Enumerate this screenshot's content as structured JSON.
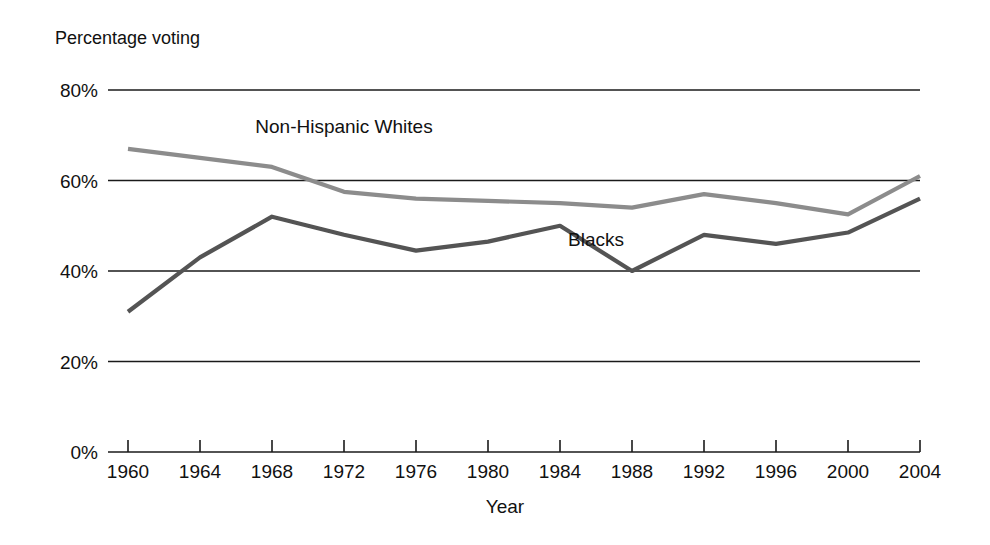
{
  "chart_data": {
    "type": "line",
    "title": "Percentage voting",
    "xlabel": "Year",
    "ylabel": "Percentage voting",
    "grid": true,
    "legend_position": "inline-labels",
    "x": [
      1960,
      1964,
      1968,
      1972,
      1976,
      1980,
      1984,
      1988,
      1992,
      1996,
      2000,
      2004
    ],
    "categories": [
      "1960",
      "1964",
      "1968",
      "1972",
      "1976",
      "1980",
      "1984",
      "1988",
      "1992",
      "1996",
      "2000",
      "2004"
    ],
    "xlim": [
      1960,
      2004
    ],
    "ylim": [
      0,
      80
    ],
    "ytick_values": [
      0,
      20,
      40,
      60,
      80
    ],
    "ytick_labels": [
      "0%",
      "20%",
      "40%",
      "60%",
      "80%"
    ],
    "series": [
      {
        "name": "Non-Hispanic Whites",
        "color": "#8c8c8c",
        "values": [
          67.0,
          65.0,
          63.0,
          57.5,
          56.0,
          55.5,
          55.0,
          54.0,
          57.0,
          55.0,
          52.5,
          61.0
        ],
        "label_x": 1972,
        "label_y": 70.5
      },
      {
        "name": "Blacks",
        "color": "#545454",
        "values": [
          31.0,
          43.0,
          52.0,
          48.0,
          44.5,
          46.5,
          50.0,
          40.0,
          48.0,
          46.0,
          48.5,
          56.0
        ],
        "label_x": 1986,
        "label_y": 45.5
      }
    ]
  },
  "colors": {
    "background": "#ffffff",
    "axis": "#1a1a1a",
    "whites_line": "#8c8c8c",
    "blacks_line": "#545454"
  }
}
